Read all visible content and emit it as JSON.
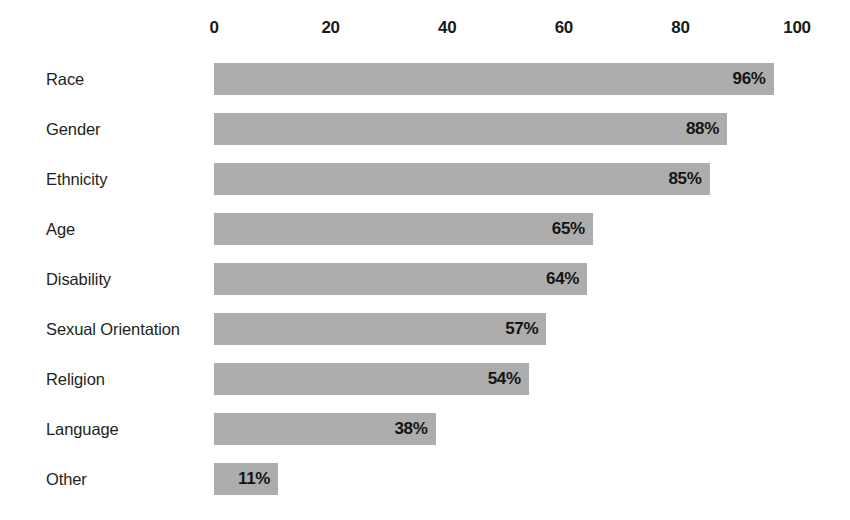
{
  "chart_data": {
    "type": "bar",
    "orientation": "horizontal",
    "title": "",
    "subtitle": "",
    "xlabel": "",
    "ylabel": "",
    "xlim": [
      0,
      100
    ],
    "grid": false,
    "legend": null,
    "value_suffix": "%",
    "xticks": [
      {
        "value": 0,
        "label": "0"
      },
      {
        "value": 20,
        "label": "20"
      },
      {
        "value": 40,
        "label": "40"
      },
      {
        "value": 60,
        "label": "60"
      },
      {
        "value": 80,
        "label": "80"
      },
      {
        "value": 100,
        "label": "100"
      }
    ],
    "categories": [
      "Race",
      "Gender",
      "Ethnicity",
      "Age",
      "Disability",
      "Sexual Orientation",
      "Religion",
      "Language",
      "Other"
    ],
    "values": [
      96,
      88,
      85,
      65,
      64,
      57,
      54,
      38,
      11
    ],
    "data_labels": [
      "96%",
      "88%",
      "85%",
      "65%",
      "64%",
      "57%",
      "54%",
      "38%",
      "11%"
    ],
    "series": [
      {
        "name": "",
        "values": [
          96,
          88,
          85,
          65,
          64,
          57,
          54,
          38,
          11
        ]
      }
    ],
    "colors": {
      "bar_fill": "#adadad",
      "background": "#ffffff",
      "text": "#231f20",
      "value_text": "#141414"
    }
  }
}
